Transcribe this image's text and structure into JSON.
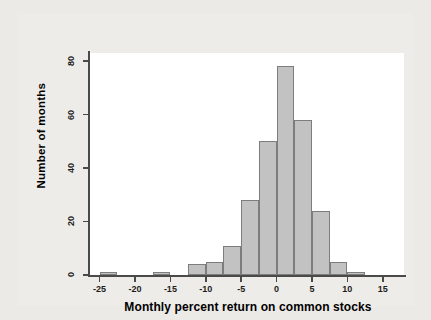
{
  "chart_data": {
    "type": "bar",
    "title": "",
    "subtitle": "",
    "xlabel": "Monthly percent return on common stocks",
    "ylabel": "Number of months",
    "xlim": [
      -26.5,
      18
    ],
    "ylim": [
      0,
      83
    ],
    "grid": false,
    "legend": null,
    "bin_width": 2.5,
    "xticks": [
      -25,
      -20,
      -15,
      -10,
      -5,
      0,
      5,
      10,
      15
    ],
    "xtick_labels": [
      "-25",
      "-20",
      "-15",
      "-10",
      "-5",
      "0",
      "5",
      "10",
      "15"
    ],
    "yticks": [
      0,
      20,
      40,
      60,
      80
    ],
    "ytick_labels": [
      "0",
      "20",
      "40",
      "60",
      "80"
    ],
    "bar_color": "#c2c2c2",
    "bar_edge_color": "#7d7d7d",
    "plot_background": "#ffffff",
    "figure_background": "#eeece8",
    "page_background": "#eceae6",
    "bins": [
      {
        "left": -25.0,
        "right": -22.5,
        "value": 1
      },
      {
        "left": -22.5,
        "right": -20.0,
        "value": 0
      },
      {
        "left": -20.0,
        "right": -17.5,
        "value": 0
      },
      {
        "left": -17.5,
        "right": -15.0,
        "value": 1
      },
      {
        "left": -15.0,
        "right": -12.5,
        "value": 0
      },
      {
        "left": -12.5,
        "right": -10.0,
        "value": 4
      },
      {
        "left": -10.0,
        "right": -7.5,
        "value": 5
      },
      {
        "left": -7.5,
        "right": -5.0,
        "value": 11
      },
      {
        "left": -5.0,
        "right": -2.5,
        "value": 28
      },
      {
        "left": -2.5,
        "right": 0.0,
        "value": 50
      },
      {
        "left": 0.0,
        "right": 2.5,
        "value": 78
      },
      {
        "left": 2.5,
        "right": 5.0,
        "value": 58
      },
      {
        "left": 5.0,
        "right": 7.5,
        "value": 24
      },
      {
        "left": 7.5,
        "right": 10.0,
        "value": 5
      },
      {
        "left": 10.0,
        "right": 12.5,
        "value": 1
      }
    ],
    "categories": [
      "-25 to -22.5",
      "-22.5 to -20",
      "-20 to -17.5",
      "-17.5 to -15",
      "-15 to -12.5",
      "-12.5 to -10",
      "-10 to -7.5",
      "-7.5 to -5",
      "-5 to -2.5",
      "-2.5 to 0",
      "0 to 2.5",
      "2.5 to 5",
      "5 to 7.5",
      "7.5 to 10",
      "10 to 12.5"
    ],
    "values": [
      1,
      0,
      0,
      1,
      0,
      4,
      5,
      11,
      28,
      50,
      78,
      58,
      24,
      5,
      1
    ]
  }
}
